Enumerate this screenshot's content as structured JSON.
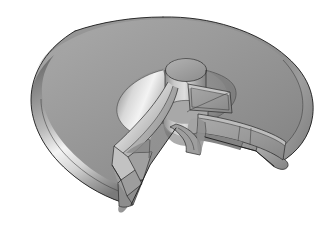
{
  "scene": {
    "title": "Impeller rotor cutaway",
    "subject": "toroidal-disc-rotor-with-vanes",
    "render_style": "shaded-solid-with-edges",
    "background_color": "#ffffff",
    "canvas": {
      "width": 331,
      "height": 228
    }
  },
  "materials": {
    "body_base": "#939393",
    "body_top": "#9a9a9a",
    "body_shadow": "#6e6e6e",
    "body_dark": "#5a5a5a",
    "rim_highlight": "#f2f2f2",
    "rim_midlight": "#c8c8c8",
    "recess_floor": "#8a8a8a",
    "recess_dark": "#6a6a6a",
    "cone_highlight": "#ededed",
    "cone_mid": "#b4b4b4",
    "hub_light": "#d2d2d2",
    "hub_mid": "#a2a2a2",
    "hub_dark": "#787878",
    "blade_bright": "#e6e6e6",
    "blade_mid": "#a8a8a8",
    "blade_dark": "#7d7d7d",
    "blade_edge_face": "#b8b8b8",
    "cut_face": "#9c9c9c",
    "cut_face_dark": "#828282",
    "edge_line": "#1c1c1c"
  },
  "parts": [
    {
      "id": "outer-torus-body",
      "label": "Outer toroidal disc body",
      "description": "Large rounded-rim disc with a pie sector removed"
    },
    {
      "id": "sector-cut-face-right",
      "label": "Right sector cut face",
      "description": "Flat radial cut plane on the right of the removed wedge"
    },
    {
      "id": "sector-cut-face-left",
      "label": "Left sector cut face",
      "description": "Flat radial cut plane at lower left of the removed wedge"
    },
    {
      "id": "inner-recess",
      "label": "Inner circular recess",
      "description": "Conical countersunk pocket around the hub"
    },
    {
      "id": "center-hub",
      "label": "Central cylindrical hub",
      "description": "Raised boss at the rotation axis"
    },
    {
      "id": "vane-left",
      "label": "Left curved vane",
      "description": "Bright curved blade sweeping down-left from the hub"
    },
    {
      "id": "vane-upper-right",
      "label": "Upper right vane",
      "description": "Thin vane seen near edge-on, outlined quadrilateral"
    },
    {
      "id": "vane-lower-right",
      "label": "Lower right vane",
      "description": "Long vane extending to the outer rim on the right"
    }
  ],
  "camera": {
    "projection": "perspective",
    "view": "three-quarter top view",
    "light_direction": "upper-left"
  },
  "annotations": {
    "visible_text": "",
    "labels": []
  }
}
